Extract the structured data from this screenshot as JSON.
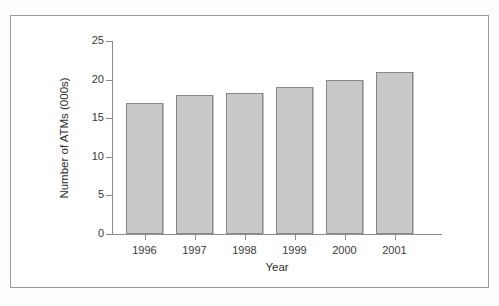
{
  "chart_data": {
    "type": "bar",
    "title": "",
    "xlabel": "Year",
    "ylabel": "Number of ATMs (000s)",
    "categories": [
      "1996",
      "1997",
      "1998",
      "1999",
      "2000",
      "2001"
    ],
    "values": [
      17,
      18,
      18.3,
      19,
      20,
      21
    ],
    "ylim": [
      0,
      25
    ],
    "yticks": [
      0,
      5,
      10,
      15,
      20,
      25
    ],
    "ytick_labels": [
      "0",
      "5",
      "10",
      "15",
      "20",
      "25"
    ],
    "grid": false,
    "legend": null,
    "series": [
      {
        "name": "Number of ATMs (000s)",
        "values": [
          17,
          18,
          18.3,
          19,
          20,
          21
        ]
      }
    ],
    "colors": {
      "bar_fill": "#c9c9c9",
      "bar_border": "#888888",
      "axis": "#8c8c8c",
      "text": "#2e2e2e",
      "frame": "#9a9a9a",
      "background": "#ffffff"
    }
  },
  "figure": {
    "frame_visible": true
  }
}
